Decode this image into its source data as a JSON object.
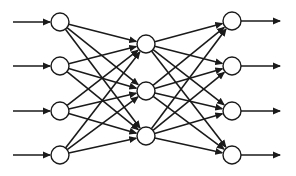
{
  "diagram": {
    "type": "feedforward-neural-network",
    "colors": {
      "stroke": "#1a1a1a",
      "node_fill": "#ffffff",
      "background": "#ffffff"
    },
    "node_radius": 9,
    "layers": [
      {
        "name": "input",
        "x": 60,
        "nodes_y": [
          22,
          66,
          111,
          155
        ]
      },
      {
        "name": "hidden",
        "x": 146,
        "nodes_y": [
          44,
          91,
          136
        ]
      },
      {
        "name": "output",
        "x": 232,
        "nodes_y": [
          21,
          66,
          111,
          155
        ]
      }
    ],
    "input_arrow_start_x": 13,
    "output_arrow_end_x": 280,
    "connections": "fully-connected"
  }
}
